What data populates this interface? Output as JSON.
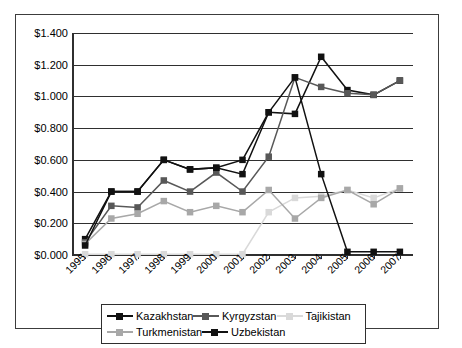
{
  "chart_data": {
    "type": "line",
    "title": "",
    "xlabel": "",
    "ylabel": "",
    "categories": [
      "1995",
      "1996",
      "1997",
      "1998",
      "1999",
      "2000",
      "2001",
      "2002",
      "2003",
      "2004",
      "2005",
      "2006",
      "2007"
    ],
    "ylim": [
      0,
      1.4
    ],
    "ytick_step": 0.2,
    "ytick_labels": [
      "$0.000",
      "$0.200",
      "$0.400",
      "$0.600",
      "$0.800",
      "$1.000",
      "$1.200",
      "$1.400"
    ],
    "ytick_values": [
      0,
      0.2,
      0.4,
      0.6,
      0.8,
      1.0,
      1.2,
      1.4
    ],
    "grid": true,
    "legend_position": "bottom",
    "marker": "square",
    "series": [
      {
        "name": "Kazakhstan",
        "color": "#111111",
        "values": [
          0.1,
          0.4,
          0.4,
          0.6,
          0.54,
          0.55,
          0.6,
          0.9,
          0.89,
          1.25,
          1.04,
          1.01,
          1.1
        ]
      },
      {
        "name": "Kyrgyzstan",
        "color": "#585858",
        "values": [
          0.08,
          0.31,
          0.3,
          0.47,
          0.4,
          0.52,
          0.4,
          0.62,
          1.12,
          1.06,
          1.02,
          1.01,
          1.1
        ]
      },
      {
        "name": "Tajikistan",
        "color": "#d9d9d9",
        "values": [
          0.005,
          0.005,
          0.005,
          0.005,
          0.005,
          0.005,
          0.005,
          0.27,
          0.36,
          0.37,
          0.41,
          0.36,
          0.42
        ]
      },
      {
        "name": "Turkmenistan",
        "color": "#a8a8a8",
        "values": [
          0.07,
          0.23,
          0.26,
          0.34,
          0.27,
          0.31,
          0.27,
          0.41,
          0.23,
          0.36,
          0.41,
          0.32,
          0.42
        ]
      },
      {
        "name": "Uzbekistan",
        "color": "#111111",
        "values": [
          0.06,
          0.4,
          0.4,
          0.6,
          0.54,
          0.55,
          0.51,
          0.9,
          1.12,
          0.51,
          0.02,
          0.02,
          0.02
        ]
      }
    ]
  },
  "legend": {
    "rows": [
      [
        "Kazakhstan",
        "Kyrgyzstan",
        "Tajikistan"
      ],
      [
        "Turkmenistan",
        "Uzbekistan"
      ]
    ]
  }
}
